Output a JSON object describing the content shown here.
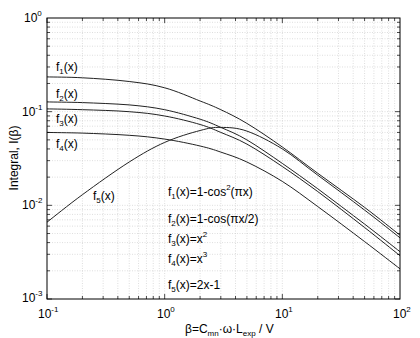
{
  "chart_data": {
    "type": "line",
    "title": "",
    "xlabel": "β=C_mn·ω·L_exp / V",
    "ylabel": "Integral, I(β)",
    "xscale": "log",
    "yscale": "log",
    "xlim": [
      0.1,
      100
    ],
    "ylim": [
      0.001,
      1
    ],
    "grid": true,
    "x_ticks": [
      "10^-1",
      "10^0",
      "10^1",
      "10^2"
    ],
    "y_ticks": [
      "10^-3",
      "10^-2",
      "10^-1",
      "10^0"
    ],
    "x": [
      0.1,
      0.2,
      0.5,
      1,
      2,
      3,
      5,
      10,
      20,
      50,
      100
    ],
    "series": [
      {
        "name": "f1(x)",
        "formula": "f1(x)=1-cos^2(πx)",
        "values": [
          0.235,
          0.23,
          0.21,
          0.18,
          0.13,
          0.105,
          0.075,
          0.042,
          0.022,
          0.0095,
          0.0048
        ]
      },
      {
        "name": "f2(x)",
        "formula": "f2(x)=1-cos(πx/2)",
        "values": [
          0.127,
          0.125,
          0.118,
          0.105,
          0.083,
          0.068,
          0.05,
          0.028,
          0.015,
          0.0063,
          0.0032
        ]
      },
      {
        "name": "f3(x)",
        "formula": "f3(x)=x^2",
        "values": [
          0.107,
          0.105,
          0.1,
          0.09,
          0.073,
          0.06,
          0.045,
          0.026,
          0.014,
          0.0058,
          0.0029
        ]
      },
      {
        "name": "f4(x)",
        "formula": "f4(x)=x^3",
        "values": [
          0.06,
          0.059,
          0.056,
          0.051,
          0.043,
          0.037,
          0.029,
          0.018,
          0.0097,
          0.0041,
          0.0021
        ]
      },
      {
        "name": "f5(x)",
        "formula": "f5(x)=2x-1",
        "values": [
          0.0066,
          0.013,
          0.029,
          0.047,
          0.063,
          0.068,
          0.062,
          0.04,
          0.021,
          0.0089,
          0.0045
        ]
      }
    ],
    "legend": [
      "f1(x)=1-cos²(πx)",
      "f2(x)=1-cos(πx/2)",
      "f3(x)=x²",
      "f4(x)=x³",
      "f5(x)=2x-1"
    ]
  },
  "labels": {
    "ylabel": "Integral, I(β)",
    "xlabel_pre": "β=C",
    "xlabel_sub1": "mn",
    "xlabel_mid": "·ω·L",
    "xlabel_sub2": "exp",
    "xlabel_post": " / V",
    "curve_labels": [
      {
        "f": "f",
        "i": "1",
        "x": "(x)"
      },
      {
        "f": "f",
        "i": "2",
        "x": "(x)"
      },
      {
        "f": "f",
        "i": "3",
        "x": "(x)"
      },
      {
        "f": "f",
        "i": "4",
        "x": "(x)"
      },
      {
        "f": "f",
        "i": "5",
        "x": "(x)"
      }
    ],
    "formulas": [
      {
        "i": "1",
        "body": "(x)=1-cos",
        "sup": "2",
        "tail": "(πx)"
      },
      {
        "i": "2",
        "body": "(x)=1-cos(πx/2)",
        "sup": "",
        "tail": ""
      },
      {
        "i": "3",
        "body": "(x)=x",
        "sup": "2",
        "tail": ""
      },
      {
        "i": "4",
        "body": "(x)=x",
        "sup": "3",
        "tail": ""
      },
      {
        "i": "5",
        "body": "(x)=2x-1",
        "sup": "",
        "tail": ""
      }
    ],
    "x_tick_base": "10",
    "x_tick_exp": [
      "-1",
      "0",
      "1",
      "2"
    ],
    "y_tick_base": "10",
    "y_tick_exp": [
      "0",
      "-1",
      "-2",
      "-3"
    ]
  }
}
